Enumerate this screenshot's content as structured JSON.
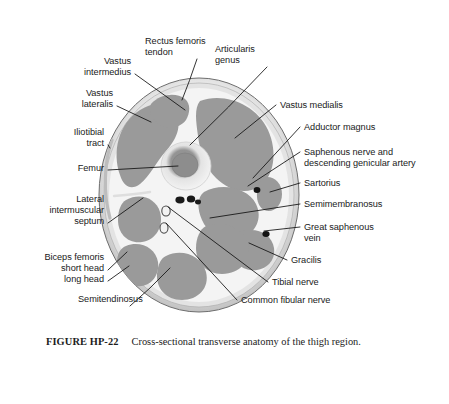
{
  "figure": {
    "caption_label": "FIGURE HP-22",
    "caption_text": "Cross-sectional transverse anatomy of the thigh region.",
    "background_color": "#ffffff",
    "muscle_color": "#9a9a9a",
    "fascia_color": "#f2f2f2",
    "fat_rim_color": "#cfcfcf",
    "outline_color": "#6e6e6e",
    "vessel_color": "#1a1a1a",
    "bone_cortex_color": "#ededed",
    "bone_marrow_color": "#8a8a8a",
    "leader_line_color": "#111111"
  },
  "labels": [
    {
      "id": "vastus-intermedius",
      "text": "Vastus\nintermedius",
      "side": "left",
      "x": 131,
      "y": 56,
      "tip_x": 185,
      "tip_y": 110
    },
    {
      "id": "rectus-femoris-tendon",
      "text": "Rectus femoris\ntendon",
      "side": "center",
      "x": 145,
      "y": 36,
      "tip_x": 182,
      "tip_y": 100
    },
    {
      "id": "articularis-genus",
      "text": "Articularis\ngenus",
      "side": "center",
      "x": 215,
      "y": 44,
      "tip_x": 190,
      "tip_y": 145
    },
    {
      "id": "vastus-lateralis",
      "text": "Vastus\nlateralis",
      "side": "left",
      "x": 113,
      "y": 88,
      "tip_x": 151,
      "tip_y": 122
    },
    {
      "id": "iliotibial-tract",
      "text": "Iliotibial\ntract",
      "side": "left",
      "x": 104,
      "y": 127,
      "tip_x": 110,
      "tip_y": 148
    },
    {
      "id": "femur",
      "text": "Femur",
      "side": "left",
      "x": 104,
      "y": 163,
      "tip_x": 178,
      "tip_y": 166
    },
    {
      "id": "lateral-intermuscular-septum",
      "text": "Lateral\nintermuscular\nseptum",
      "side": "left",
      "x": 104,
      "y": 194,
      "tip_x": 143,
      "tip_y": 198
    },
    {
      "id": "biceps-femoris",
      "text": "Biceps femoris",
      "side": "left",
      "x": 104,
      "y": 252,
      "tip_x": 0,
      "tip_y": 0
    },
    {
      "id": "biceps-short-head",
      "text": "short head",
      "side": "left",
      "x": 104,
      "y": 263,
      "tip_x": 127,
      "tip_y": 252
    },
    {
      "id": "biceps-long-head",
      "text": "long head",
      "side": "left",
      "x": 104,
      "y": 274,
      "tip_x": 129,
      "tip_y": 266
    },
    {
      "id": "semitendinosus",
      "text": "Semitendinosus",
      "side": "center",
      "x": 78,
      "y": 294,
      "tip_x": 170,
      "tip_y": 268
    },
    {
      "id": "vastus-medialis",
      "text": "Vastus medialis",
      "side": "right",
      "x": 280,
      "y": 100,
      "tip_x": 235,
      "tip_y": 138
    },
    {
      "id": "adductor-magnus",
      "text": "Adductor magnus",
      "side": "right",
      "x": 304,
      "y": 122,
      "tip_x": 253,
      "tip_y": 178
    },
    {
      "id": "saphenous-nerve",
      "text": "Saphenous nerve and\ndescending genicular artery",
      "side": "right",
      "x": 304,
      "y": 147,
      "tip_x": 248,
      "tip_y": 186
    },
    {
      "id": "sartorius",
      "text": "Sartorius",
      "side": "right",
      "x": 304,
      "y": 178,
      "tip_x": 270,
      "tip_y": 192
    },
    {
      "id": "semimembranosus",
      "text": "Semimembranosus",
      "side": "right",
      "x": 304,
      "y": 199,
      "tip_x": 210,
      "tip_y": 218
    },
    {
      "id": "great-saphenous-vein",
      "text": "Great saphenous\nvein",
      "side": "right",
      "x": 304,
      "y": 222,
      "tip_x": 264,
      "tip_y": 231
    },
    {
      "id": "gracilis",
      "text": "Gracilis",
      "side": "right",
      "x": 291,
      "y": 255,
      "tip_x": 249,
      "tip_y": 243
    },
    {
      "id": "tibial-nerve",
      "text": "Tibial nerve",
      "side": "right",
      "x": 272,
      "y": 277,
      "tip_x": 168,
      "tip_y": 207
    },
    {
      "id": "common-fibular-nerve",
      "text": "Common fibular nerve",
      "side": "right",
      "x": 241,
      "y": 295,
      "tip_x": 166,
      "tip_y": 223
    }
  ]
}
